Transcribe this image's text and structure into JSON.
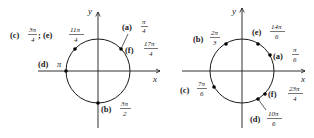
{
  "diagrams": [
    {
      "id": "left",
      "axis_labels": {
        "x": "x",
        "y": "y"
      },
      "points": [
        {
          "tag": "(a)",
          "num": "π",
          "den": "4"
        },
        {
          "tag": "(f)",
          "num": "17π",
          "den": "4"
        },
        {
          "tag": "(c)",
          "num": "3π",
          "den": "4"
        },
        {
          "tag": "(e)",
          "num": "11π",
          "den": "4"
        },
        {
          "tag": "(d)",
          "value": "π"
        },
        {
          "tag": "(b)",
          "num": "3π",
          "den": "2"
        }
      ],
      "separator": ";"
    },
    {
      "id": "right",
      "axis_labels": {
        "x": "x",
        "y": "y"
      },
      "points": [
        {
          "tag": "(b)",
          "num": "2π",
          "den": "3"
        },
        {
          "tag": "(e)",
          "num": "14π",
          "den": "6"
        },
        {
          "tag": "(a)",
          "num": "π",
          "den": "6"
        },
        {
          "tag": "(c)",
          "num": "7π",
          "den": "6"
        },
        {
          "tag": "(f)",
          "num": "23π",
          "den": "4"
        },
        {
          "tag": "(d)",
          "num": "10π",
          "den": "6"
        }
      ]
    }
  ]
}
